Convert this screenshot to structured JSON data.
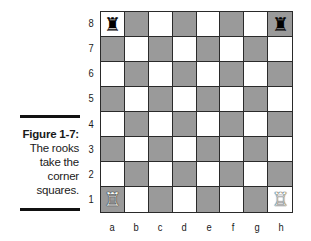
{
  "caption": {
    "title": "Figure 1-7:",
    "lines": [
      "The rooks",
      "take the",
      "corner",
      "squares."
    ]
  },
  "board": {
    "ranks": [
      "8",
      "7",
      "6",
      "5",
      "4",
      "3",
      "2",
      "1"
    ],
    "files": [
      "a",
      "b",
      "c",
      "d",
      "e",
      "f",
      "g",
      "h"
    ],
    "light_color": "#ffffff",
    "dark_color": "#9a9a9a",
    "pieces": [
      {
        "square": "a8",
        "piece": "rook",
        "color": "black",
        "glyph": "♜"
      },
      {
        "square": "h8",
        "piece": "rook",
        "color": "black",
        "glyph": "♜"
      },
      {
        "square": "a1",
        "piece": "rook",
        "color": "white",
        "glyph": "♖"
      },
      {
        "square": "h1",
        "piece": "rook",
        "color": "white",
        "glyph": "♖"
      }
    ]
  }
}
